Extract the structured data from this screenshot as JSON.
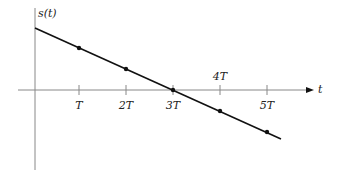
{
  "diagram": {
    "y_axis_label": "s(t)",
    "x_axis_label": "t",
    "ticks": [
      {
        "label": "T",
        "value": 1,
        "label_position": "below"
      },
      {
        "label": "2T",
        "value": 2,
        "label_position": "below"
      },
      {
        "label": "3T",
        "value": 3,
        "label_position": "below"
      },
      {
        "label": "4T",
        "value": 4,
        "label_position": "above"
      },
      {
        "label": "5T",
        "value": 5,
        "label_position": "below"
      }
    ],
    "line": {
      "description": "straight line with negative slope crossing zero at 3T",
      "sample_points_at": [
        "T",
        "2T",
        "3T",
        "4T",
        "5T"
      ]
    },
    "colors": {
      "axis": "#888888",
      "line": "#111111",
      "text": "#222222"
    }
  }
}
